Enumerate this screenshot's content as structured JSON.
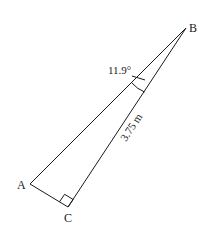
{
  "diagram": {
    "type": "right-triangle",
    "vertices": {
      "A": {
        "label": "A",
        "x": 30,
        "y": 184
      },
      "B": {
        "label": "B",
        "x": 186,
        "y": 28
      },
      "C": {
        "label": "C",
        "x": 68,
        "y": 207
      }
    },
    "right_angle_at": "C",
    "angle_label": "11.9°",
    "angle_at": "B",
    "side_label": "3.75 m",
    "side_labeled": "BC",
    "stroke_color": "#1a1a1a",
    "background": "#ffffff"
  }
}
